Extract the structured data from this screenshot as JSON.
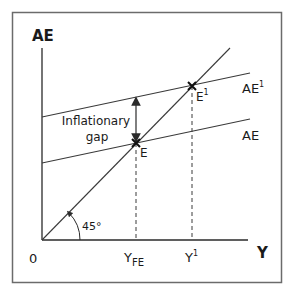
{
  "diagram": {
    "type": "keynesian-cross",
    "y_axis_label": "AE",
    "x_axis_label": "Y",
    "origin_label": "0",
    "angle_label": "45°",
    "gap_label_line1": "Inflationary",
    "gap_label_line2": "gap",
    "curves": [
      {
        "name": "AE1",
        "label_base": "AE",
        "label_sup": "1"
      },
      {
        "name": "AE",
        "label_base": "AE",
        "label_sup": ""
      },
      {
        "name": "45-degree-line",
        "label_base": "",
        "label_sup": ""
      }
    ],
    "points": [
      {
        "name": "E",
        "label_base": "E",
        "label_sup": ""
      },
      {
        "name": "E1",
        "label_base": "E",
        "label_sup": "1"
      }
    ],
    "x_ticks": [
      {
        "name": "YFE",
        "label_base": "Y",
        "label_sub": "FE"
      },
      {
        "name": "Y1",
        "label_base": "Y",
        "label_sup": "1"
      }
    ]
  },
  "colors": {
    "frame": "#6b6b6b",
    "line": "#3a3a3a",
    "text": "#1a1a1a"
  }
}
